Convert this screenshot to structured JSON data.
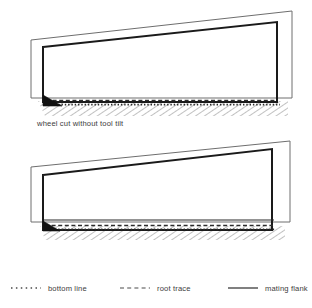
{
  "figures": [
    {
      "id": "wheel-cut-without-tool-tilt",
      "caption": "wheel cut without tool tilt",
      "elements": {
        "tool_outline": "gray-quadrilateral",
        "mating_flank": "black-quadrilateral",
        "root_trace": "dashed-line",
        "bottom_line": "dotted-line",
        "wedge": "black-triangle",
        "material": "diagonal-hatching"
      }
    },
    {
      "id": "wheel-cut-with-tool-tilt",
      "caption": "wheel cut with tool tilt",
      "elements": {
        "tool_outline": "gray-quadrilateral",
        "mating_flank": "black-quadrilateral",
        "root_trace": "dashed-line",
        "bottom_line": "dotted-line",
        "wedge": "black-triangle",
        "material": "diagonal-hatching"
      }
    }
  ],
  "legend": {
    "items": [
      {
        "label": "bottom line",
        "style": "dotted",
        "color": "#4a4a4a"
      },
      {
        "label": "root trace",
        "style": "dashed",
        "color": "#4a4a4a"
      },
      {
        "label": "mating flank",
        "style": "solid",
        "color": "#4a4a4a"
      }
    ]
  },
  "colors": {
    "mating_flank": "#1a1a1a",
    "tool_outline": "#6e6e6e",
    "hatching": "#8a8a8a",
    "text": "#3c3c3c",
    "background": "#ffffff"
  }
}
